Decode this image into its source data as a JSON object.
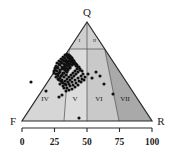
{
  "figure": {
    "type": "ternary-diagram",
    "apex_label": "Q",
    "left_label": "F",
    "right_label": "R"
  },
  "axis": {
    "ticks": [
      "0",
      "25",
      "50",
      "75",
      "100"
    ],
    "tick_values": [
      0,
      25,
      50,
      75,
      100
    ]
  },
  "fields": {
    "apex": [
      {
        "id": "field-1",
        "label": "I"
      },
      {
        "id": "field-2",
        "label": "II"
      }
    ],
    "base": [
      {
        "id": "field-4",
        "label": "IV"
      },
      {
        "id": "field-5",
        "label": "V"
      },
      {
        "id": "field-6",
        "label": "VI"
      },
      {
        "id": "field-7",
        "label": "VII"
      }
    ]
  },
  "colors": {
    "fill_light": "#d8d8d8",
    "fill_mid": "#c9c9c9",
    "fill_dark": "#a9a9a9",
    "fill_apex": "#cfcfcf",
    "outline": "#2b2b2b",
    "point": "#111111",
    "background": "#ffffff"
  },
  "chart_data": {
    "type": "scatter",
    "title": "",
    "xlabel": "",
    "ylabel": "",
    "ternary_axes": {
      "top": "Q",
      "bottom_left": "F",
      "bottom_right": "R"
    },
    "axis_ticks": [
      0,
      25,
      50,
      75,
      100
    ],
    "grid": false,
    "legend": null,
    "n_points": 136,
    "points_px": [
      [
        62,
        80
      ],
      [
        64,
        77
      ],
      [
        66,
        75
      ],
      [
        67,
        72
      ],
      [
        65,
        70
      ],
      [
        63,
        73
      ],
      [
        61,
        76
      ],
      [
        68,
        70
      ],
      [
        70,
        68
      ],
      [
        69,
        65
      ],
      [
        67,
        63
      ],
      [
        65,
        66
      ],
      [
        64,
        69
      ],
      [
        66,
        68
      ],
      [
        68,
        66
      ],
      [
        70,
        64
      ],
      [
        71,
        62
      ],
      [
        72,
        60
      ],
      [
        70,
        59
      ],
      [
        68,
        61
      ],
      [
        66,
        62
      ],
      [
        64,
        64
      ],
      [
        62,
        67
      ],
      [
        60,
        70
      ],
      [
        59,
        73
      ],
      [
        58,
        76
      ],
      [
        60,
        78
      ],
      [
        62,
        75
      ],
      [
        64,
        73
      ],
      [
        66,
        71
      ],
      [
        68,
        69
      ],
      [
        70,
        67
      ],
      [
        72,
        65
      ],
      [
        73,
        63
      ],
      [
        74,
        61
      ],
      [
        72,
        58
      ],
      [
        70,
        56
      ],
      [
        68,
        58
      ],
      [
        66,
        60
      ],
      [
        64,
        61
      ],
      [
        62,
        63
      ],
      [
        60,
        65
      ],
      [
        58,
        68
      ],
      [
        57,
        71
      ],
      [
        56,
        74
      ],
      [
        58,
        79
      ],
      [
        61,
        81
      ],
      [
        63,
        83
      ],
      [
        65,
        81
      ],
      [
        67,
        79
      ],
      [
        69,
        77
      ],
      [
        71,
        75
      ],
      [
        73,
        73
      ],
      [
        75,
        71
      ],
      [
        77,
        69
      ],
      [
        76,
        66
      ],
      [
        74,
        64
      ],
      [
        72,
        62
      ],
      [
        71,
        59
      ],
      [
        69,
        57
      ],
      [
        67,
        56
      ],
      [
        65,
        58
      ],
      [
        63,
        60
      ],
      [
        61,
        62
      ],
      [
        59,
        64
      ],
      [
        57,
        67
      ],
      [
        55,
        70
      ],
      [
        54,
        73
      ],
      [
        56,
        77
      ],
      [
        59,
        80
      ],
      [
        62,
        82
      ],
      [
        65,
        84
      ],
      [
        68,
        82
      ],
      [
        70,
        80
      ],
      [
        72,
        78
      ],
      [
        74,
        76
      ],
      [
        76,
        74
      ],
      [
        78,
        72
      ],
      [
        80,
        70
      ],
      [
        79,
        67
      ],
      [
        77,
        65
      ],
      [
        75,
        63
      ],
      [
        73,
        60
      ],
      [
        71,
        57
      ],
      [
        69,
        55
      ],
      [
        67,
        54
      ],
      [
        65,
        55
      ],
      [
        63,
        57
      ],
      [
        61,
        59
      ],
      [
        59,
        61
      ],
      [
        57,
        63
      ],
      [
        56,
        66
      ],
      [
        55,
        68
      ],
      [
        54,
        71
      ],
      [
        60,
        84
      ],
      [
        63,
        86
      ],
      [
        66,
        85
      ],
      [
        69,
        84
      ],
      [
        72,
        82
      ],
      [
        75,
        80
      ],
      [
        78,
        78
      ],
      [
        81,
        76
      ],
      [
        83,
        74
      ],
      [
        82,
        71
      ],
      [
        80,
        69
      ],
      [
        78,
        67
      ],
      [
        76,
        64
      ],
      [
        74,
        62
      ],
      [
        72,
        59
      ],
      [
        70,
        61
      ],
      [
        68,
        63
      ],
      [
        66,
        65
      ],
      [
        64,
        67
      ],
      [
        62,
        69
      ],
      [
        60,
        72
      ],
      [
        58,
        74
      ],
      [
        64,
        88
      ],
      [
        67,
        88
      ],
      [
        70,
        86
      ],
      [
        73,
        85
      ],
      [
        76,
        83
      ],
      [
        79,
        81
      ],
      [
        82,
        79
      ],
      [
        85,
        77
      ],
      [
        84,
        80
      ],
      [
        81,
        82
      ],
      [
        78,
        85
      ],
      [
        75,
        87
      ],
      [
        72,
        89
      ],
      [
        69,
        90
      ],
      [
        66,
        91
      ],
      [
        88,
        74
      ],
      [
        92,
        78
      ],
      [
        96,
        72
      ],
      [
        100,
        76
      ],
      [
        104,
        84
      ],
      [
        113,
        94
      ],
      [
        46,
        91
      ],
      [
        31,
        82
      ],
      [
        79,
        118
      ],
      [
        62,
        95
      ],
      [
        59,
        97
      ]
    ]
  }
}
